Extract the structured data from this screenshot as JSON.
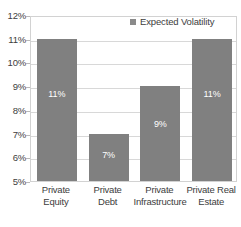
{
  "chart_data": {
    "type": "bar",
    "title": "",
    "subtitle": "",
    "xlabel": "",
    "ylabel": "",
    "categories": [
      "Private Equity",
      "Private Debt",
      "Private Infrastructure",
      "Private Real Estate"
    ],
    "category_lines": [
      [
        "Private",
        "Equity"
      ],
      [
        "Private",
        "Debt"
      ],
      [
        "Private",
        "Infrastructure"
      ],
      [
        "Private Real",
        "Estate"
      ]
    ],
    "values": [
      11,
      7,
      9,
      11
    ],
    "value_labels": [
      "11%",
      "7%",
      "9%",
      "11%"
    ],
    "series": [
      {
        "name": "Expected Volatility",
        "values": [
          11,
          7,
          9,
          11
        ]
      }
    ],
    "ylim": [
      5,
      12
    ],
    "ytick_values": [
      12,
      11,
      10,
      9,
      8,
      7,
      6,
      5
    ],
    "ytick_labels": [
      "12%",
      "11%",
      "10%",
      "9%",
      "8%",
      "7%",
      "6%",
      "5%"
    ],
    "grid": true,
    "legend": {
      "position": "top-right-inside",
      "entries": [
        "Expected Volatility"
      ]
    },
    "colors": {
      "bar": "#808080",
      "legend_marker": "#8a8a8a",
      "gridline": "#d8d8d8",
      "frame": "#d2d2d2",
      "text": "#3d3d3d",
      "value_label": "#ffffff",
      "background": "#ffffff"
    }
  }
}
